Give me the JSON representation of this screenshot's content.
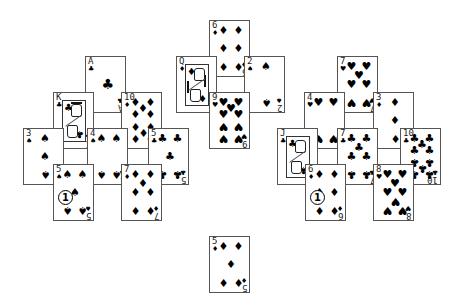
{
  "game": {
    "type": "solitaire-pyramid-tableau",
    "card_size": {
      "w": 41,
      "h": 57
    }
  },
  "colors": {
    "background": "#ffffff",
    "card_border": "#555555",
    "pip": "#000000"
  },
  "cards": [
    {
      "id": "c0",
      "rank": "A",
      "suit": "clubs",
      "glyph": "♣",
      "x": 85,
      "y": 56,
      "group": "left"
    },
    {
      "id": "c1",
      "rank": "K",
      "suit": "clubs",
      "glyph": "♣",
      "x": 53,
      "y": 92,
      "group": "left",
      "face": true
    },
    {
      "id": "c2",
      "rank": "10",
      "suit": "diamonds",
      "glyph": "♦",
      "x": 121,
      "y": 92,
      "group": "left"
    },
    {
      "id": "c3",
      "rank": "3",
      "suit": "spades",
      "glyph": "♠",
      "x": 23,
      "y": 128,
      "group": "left"
    },
    {
      "id": "c4",
      "rank": "4",
      "suit": "spades",
      "glyph": "♠",
      "x": 87,
      "y": 128,
      "group": "left"
    },
    {
      "id": "c5",
      "rank": "5",
      "suit": "clubs",
      "glyph": "♣",
      "x": 148,
      "y": 128,
      "group": "left"
    },
    {
      "id": "c6",
      "rank": "5",
      "suit": "spades",
      "glyph": "♠",
      "x": 53,
      "y": 164,
      "group": "left",
      "badge": "1"
    },
    {
      "id": "c7",
      "rank": "7",
      "suit": "diamonds",
      "glyph": "♦",
      "x": 121,
      "y": 164,
      "group": "left"
    },
    {
      "id": "c8",
      "rank": "6",
      "suit": "diamonds",
      "glyph": "♦",
      "x": 209,
      "y": 20,
      "group": "middle"
    },
    {
      "id": "c9",
      "rank": "Q",
      "suit": "diamonds",
      "glyph": "♦",
      "x": 176,
      "y": 56,
      "group": "middle",
      "face": true
    },
    {
      "id": "c10",
      "rank": "2",
      "suit": "spades",
      "glyph": "♠",
      "x": 244,
      "y": 56,
      "group": "middle"
    },
    {
      "id": "c11",
      "rank": "9",
      "suit": "hearts",
      "glyph": "♥",
      "x": 209,
      "y": 92,
      "group": "middle"
    },
    {
      "id": "c12",
      "rank": "7",
      "suit": "hearts",
      "glyph": "♥",
      "x": 337,
      "y": 56,
      "group": "right"
    },
    {
      "id": "c13",
      "rank": "4",
      "suit": "hearts",
      "glyph": "♥",
      "x": 304,
      "y": 92,
      "group": "right"
    },
    {
      "id": "c14",
      "rank": "3",
      "suit": "diamonds",
      "glyph": "♦",
      "x": 373,
      "y": 92,
      "group": "right"
    },
    {
      "id": "c15",
      "rank": "J",
      "suit": "clubs",
      "glyph": "♣",
      "x": 277,
      "y": 128,
      "group": "right",
      "face": true
    },
    {
      "id": "c16",
      "rank": "7",
      "suit": "clubs",
      "glyph": "♣",
      "x": 337,
      "y": 128,
      "group": "right"
    },
    {
      "id": "c17",
      "rank": "10",
      "suit": "clubs",
      "glyph": "♣",
      "x": 400,
      "y": 128,
      "group": "right"
    },
    {
      "id": "c18",
      "rank": "6",
      "suit": "diamonds",
      "glyph": "♦",
      "x": 305,
      "y": 164,
      "group": "right",
      "badge": "1"
    },
    {
      "id": "c19",
      "rank": "8",
      "suit": "hearts",
      "glyph": "♥",
      "x": 373,
      "y": 164,
      "group": "right"
    },
    {
      "id": "c20",
      "rank": "5",
      "suit": "diamonds",
      "glyph": "♦",
      "x": 209,
      "y": 236,
      "group": "waste"
    }
  ]
}
